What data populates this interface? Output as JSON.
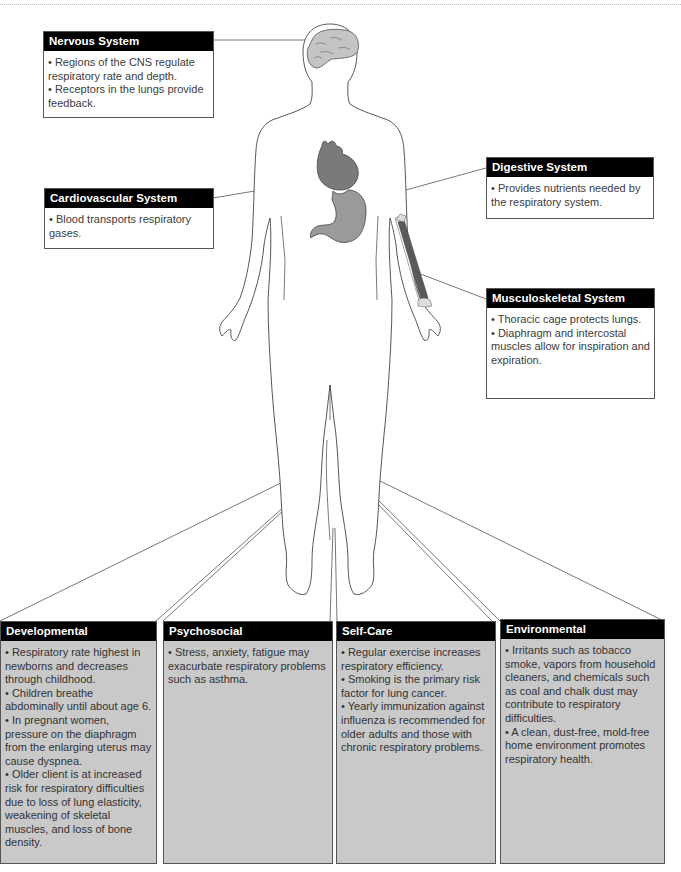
{
  "systems": {
    "nervous": {
      "title": "Nervous System",
      "bullets": [
        "• Regions of the CNS regulate respiratory rate and depth.",
        "• Receptors in the lungs provide feedback."
      ]
    },
    "cardiovascular": {
      "title": "Cardiovascular System",
      "bullets": [
        "• Blood transports respiratory gases."
      ]
    },
    "digestive": {
      "title": "Digestive System",
      "bullets": [
        "• Provides nutrients needed by the respiratory system."
      ]
    },
    "musculoskeletal": {
      "title": "Musculoskeletal System",
      "bullets": [
        "• Thoracic cage protects lungs.",
        "• Diaphragm and intercostal muscles allow for inspiration and expiration."
      ]
    }
  },
  "factors": {
    "developmental": {
      "title": "Developmental",
      "bullets": [
        "• Respiratory rate highest in newborns and decreases through childhood.",
        "• Children breathe abdominally until about age 6.",
        "• In pregnant women, pressure on the diaphragm from the enlarging uterus may cause dyspnea.",
        "• Older client is at increased risk for respiratory difficulties due to loss of lung elasticity, weakening of skeletal muscles, and loss of bone density."
      ]
    },
    "psychosocial": {
      "title": "Psychosocial",
      "bullets": [
        "• Stress, anxiety, fatigue may exacurbate respiratory problems such as asthma."
      ]
    },
    "selfcare": {
      "title": "Self-Care",
      "bullets": [
        "• Regular exercise increases respiratory efficiency.",
        "• Smoking is the primary risk factor for lung cancer.",
        "• Yearly immunization against influenza is recommended for older adults and those with chronic respiratory problems."
      ]
    },
    "environmental": {
      "title": "Environmental",
      "bullets": [
        "• Irritants such as tobacco smoke, vapors from household cleaners, and chemicals such as coal and chalk dust may contribute to respiratory difficulties.",
        "• A clean, dust-free, mold-free home environment promotes respiratory health."
      ]
    }
  },
  "colors": {
    "header_bg": "#000000",
    "factor_box_bg": "#c9c9c9",
    "organ_dark": "#7a7a7a",
    "organ_light": "#bdbdbd"
  },
  "icons": [
    "human-body-outline-icon",
    "brain-icon",
    "heart-icon",
    "stomach-icon",
    "forearm-muscle-icon"
  ]
}
